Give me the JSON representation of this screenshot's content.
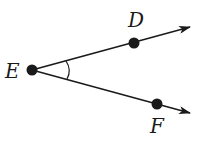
{
  "diagram": {
    "type": "angle",
    "angle_name": "DEF",
    "vertex": {
      "label": "E",
      "x": 32,
      "y": 70
    },
    "points": [
      {
        "label": "D",
        "x": 134,
        "y": 43,
        "label_x": 128,
        "label_y": 27
      },
      {
        "label": "F",
        "x": 157,
        "y": 104,
        "label_x": 150,
        "label_y": 133
      }
    ],
    "rays": [
      {
        "name": "ray-ED",
        "from": [
          32,
          70
        ],
        "to": [
          190,
          27
        ]
      },
      {
        "name": "ray-EF",
        "from": [
          32,
          70
        ],
        "to": [
          190,
          113
        ]
      }
    ],
    "angle_arc_marker": true,
    "colors": {
      "stroke": "#1a1a1a",
      "background": "#ffffff"
    }
  }
}
